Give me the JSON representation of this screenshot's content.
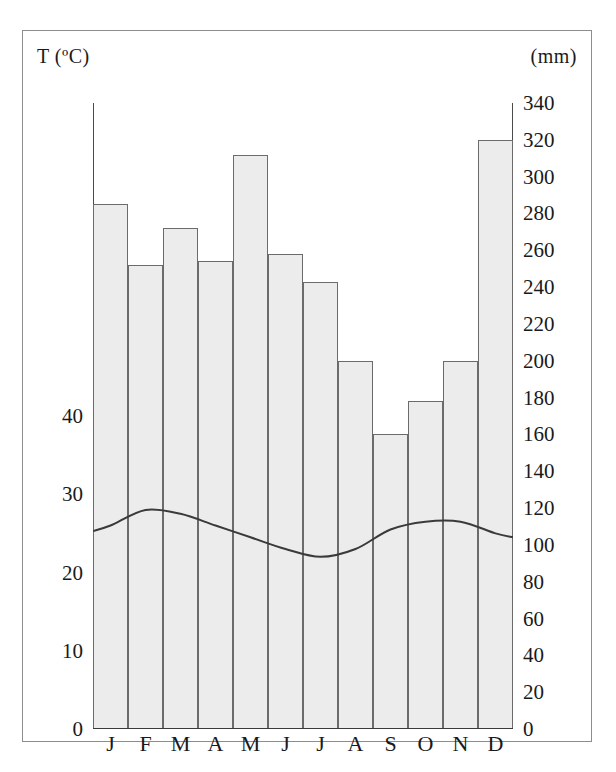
{
  "figure": {
    "type": "climograph",
    "temperature_axis_title": "T (ºC)",
    "precipitation_axis_title": "(mm)"
  },
  "chart_data": {
    "type": "bar",
    "title": "",
    "xlabel": "",
    "ylabel": "(mm)",
    "y2label": "T (ºC)",
    "grid": false,
    "legend": "none",
    "categories": [
      "J",
      "F",
      "M",
      "A",
      "M",
      "J",
      "J",
      "A",
      "S",
      "O",
      "N",
      "D"
    ],
    "month_names": [
      "January",
      "February",
      "March",
      "April",
      "May",
      "June",
      "July",
      "August",
      "September",
      "October",
      "November",
      "December"
    ],
    "series": [
      {
        "name": "Precipitation",
        "unit": "mm",
        "render": "bar",
        "axis": "right",
        "values": [
          285,
          252,
          272,
          254,
          312,
          258,
          243,
          200,
          160,
          178,
          200,
          320
        ]
      },
      {
        "name": "Temperature",
        "unit": "ºC",
        "render": "line",
        "axis": "left",
        "values": [
          26,
          28,
          27.5,
          26,
          24.5,
          23,
          22,
          23,
          25.5,
          26.5,
          26.5,
          25
        ]
      }
    ],
    "ylim_right": [
      0,
      340
    ],
    "ytick_right": [
      340,
      320,
      300,
      280,
      260,
      240,
      220,
      200,
      180,
      160,
      140,
      120,
      100,
      80,
      60,
      40,
      20,
      0
    ],
    "ylim_left": [
      0,
      80
    ],
    "ytick_left": [
      40,
      30,
      20,
      10,
      0
    ]
  },
  "colors": {
    "bar_fill": "#ececec",
    "bar_stroke": "#6b6b6b",
    "curve_stroke": "#3a3a3a",
    "axis": "#4a4a4a",
    "frame": "#8d8d8d",
    "text": "#1a1a1a"
  }
}
